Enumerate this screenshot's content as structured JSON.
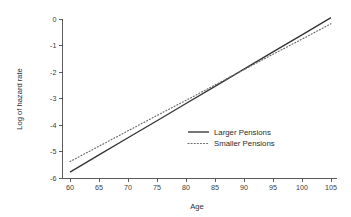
{
  "chart_data": {
    "type": "line",
    "title": "",
    "xlabel": "Age",
    "ylabel": "Log of hazard rate",
    "xlim": [
      58,
      106
    ],
    "ylim": [
      -6,
      0.3
    ],
    "xticks": [
      60,
      65,
      70,
      75,
      80,
      85,
      90,
      95,
      100,
      105
    ],
    "xtick_labels": [
      "60",
      "65",
      "70",
      "75",
      "80",
      "85",
      "90",
      "95",
      "100",
      "105"
    ],
    "yticks": [
      0,
      -1,
      -2,
      -3,
      -4,
      -5,
      -6
    ],
    "ytick_labels": [
      "0",
      "-1",
      "-2",
      "-3",
      "-4",
      "-5",
      "-6"
    ],
    "grid": false,
    "legend_position": "center-right-inside",
    "x": [
      60,
      65,
      70,
      75,
      80,
      85,
      90,
      95,
      100,
      105
    ],
    "series": [
      {
        "name": "Larger Pensions",
        "style": "solid",
        "color": "#343434",
        "values": [
          -5.78,
          -5.13,
          -4.48,
          -3.84,
          -3.19,
          -2.54,
          -1.89,
          -1.24,
          -0.6,
          0.05
        ]
      },
      {
        "name": "Smaller Pensions",
        "style": "dotted",
        "color": "#6a6a6a",
        "values": [
          -5.38,
          -4.8,
          -4.22,
          -3.64,
          -3.07,
          -2.49,
          -1.91,
          -1.33,
          -0.76,
          -0.18
        ]
      }
    ]
  },
  "axes": {
    "x_title": "Age",
    "y_title": "Log of hazard rate"
  },
  "legend": {
    "entries": [
      {
        "label": "Larger Pensions",
        "style": "solid"
      },
      {
        "label": "Smaller Pensions",
        "style": "dotted"
      }
    ]
  }
}
